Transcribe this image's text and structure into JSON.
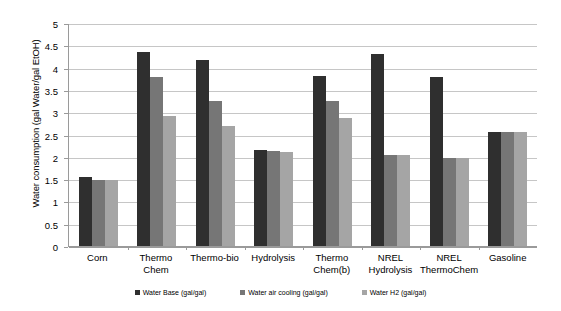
{
  "chart_data": {
    "type": "bar",
    "title": "",
    "xlabel": "",
    "ylabel": "Water consumption (gal Water/gal EtOH)",
    "ylim": [
      0,
      5
    ],
    "ytick_labels": [
      "5",
      "4.5",
      "4",
      "3.5",
      "3",
      "2.5",
      "2",
      "1.5",
      "1",
      "0.5",
      "0"
    ],
    "ytick_values": [
      5,
      4.5,
      4,
      3.5,
      3,
      2.5,
      2,
      1.5,
      1,
      0.5,
      0
    ],
    "grid": true,
    "legend_position": "bottom",
    "categories": [
      "Corn",
      "Thermo Chem",
      "Thermo-bio",
      "Hydrolysis",
      "Thermo\nChem(b)",
      "NREL\nHydrolysis",
      "NREL\nThermoChem",
      "Gasoline"
    ],
    "series": [
      {
        "name": "Water Base (gal/gal)",
        "color": "#2f2f2f",
        "values": [
          1.55,
          4.35,
          4.18,
          2.15,
          3.82,
          4.3,
          3.8,
          2.55
        ]
      },
      {
        "name": "Water air cooling (gal/gal)",
        "color": "#767676",
        "values": [
          1.47,
          3.78,
          3.25,
          2.12,
          3.25,
          2.05,
          1.98,
          2.55
        ]
      },
      {
        "name": "Water H2 (gal/gal)",
        "color": "#a5a5a5",
        "values": [
          1.47,
          2.92,
          2.68,
          2.1,
          2.88,
          2.05,
          1.98,
          2.55
        ]
      }
    ]
  },
  "legend": {
    "items": [
      {
        "label": "Water Base (gal/gal)",
        "marker": "square-swatch-dark"
      },
      {
        "label": "Water air cooling (gal/gal)",
        "marker": "square-swatch-mid"
      },
      {
        "label": "Water H2 (gal/gal)",
        "marker": "square-swatch-light"
      }
    ]
  }
}
